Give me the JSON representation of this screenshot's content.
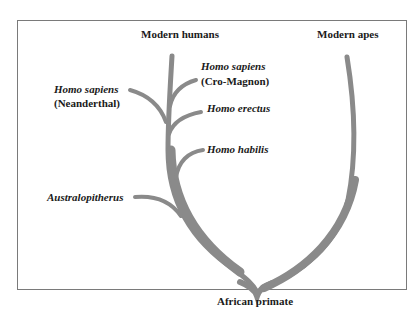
{
  "diagram": {
    "type": "evolutionary-tree",
    "colors": {
      "branch": "#8a8a8a",
      "frame": "#7a7a7a",
      "text": "#1a1a1a"
    },
    "labels": {
      "modern_humans": "Modern humans",
      "modern_apes": "Modern apes",
      "neanderthal_name": "Homo sapiens",
      "neanderthal_note": "(Neanderthal)",
      "cromagnon_name": "Homo sapiens",
      "cromagnon_note": "(Cro-Magnon)",
      "erectus": "Homo erectus",
      "habilis": "Homo habilis",
      "australopithecus": "Australopitherus",
      "root": "African primate"
    },
    "nodes": [
      {
        "id": "root",
        "label": "African primate"
      },
      {
        "id": "apes",
        "label": "Modern apes",
        "parent": "root"
      },
      {
        "id": "australopithecus",
        "label": "Australopitherus",
        "parent": "root"
      },
      {
        "id": "habilis",
        "label": "Homo habilis",
        "parent": "root"
      },
      {
        "id": "erectus",
        "label": "Homo erectus",
        "parent": "root"
      },
      {
        "id": "neanderthal",
        "label": "Homo sapiens (Neanderthal)",
        "parent": "root"
      },
      {
        "id": "cromagnon",
        "label": "Homo sapiens (Cro-Magnon)",
        "parent": "root"
      },
      {
        "id": "humans",
        "label": "Modern humans",
        "parent": "root"
      }
    ]
  }
}
